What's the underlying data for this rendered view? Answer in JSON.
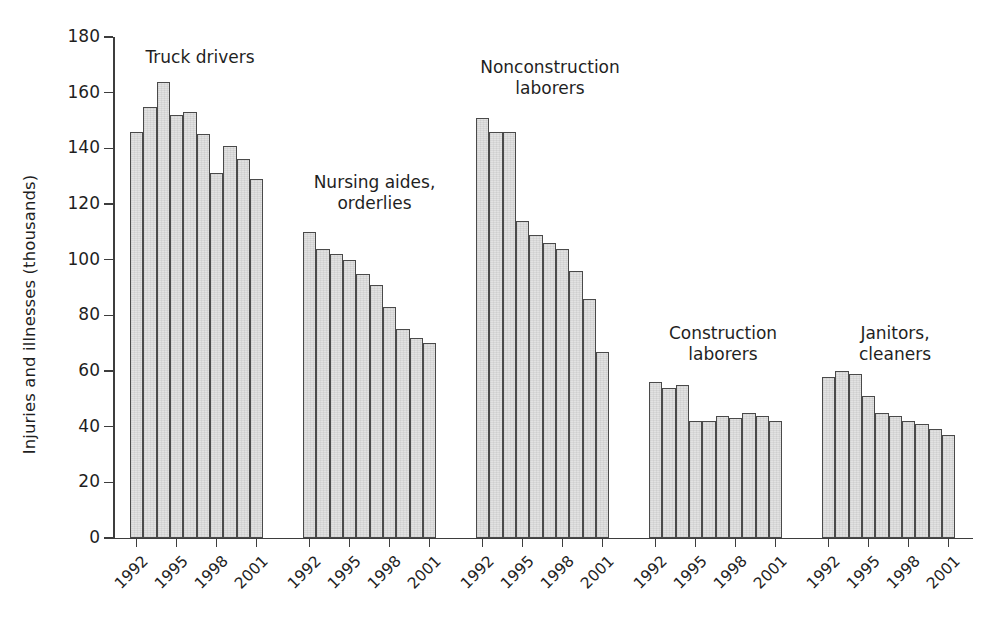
{
  "chart_data": {
    "type": "bar",
    "title": "",
    "xlabel": "",
    "ylabel": "Injuries and illnesses (thousands)",
    "ylim": [
      0,
      180
    ],
    "ytick_labels": [
      "0",
      "20",
      "40",
      "60",
      "80",
      "100",
      "120",
      "140",
      "160",
      "180"
    ],
    "ytick_values": [
      0,
      20,
      40,
      60,
      80,
      100,
      120,
      140,
      160,
      180
    ],
    "grid": false,
    "legend": "none",
    "x": [
      1992,
      1993,
      1994,
      1995,
      1996,
      1997,
      1998,
      1999,
      2000,
      2001
    ],
    "xtick_labels": [
      "1992",
      "1995",
      "1998",
      "2001"
    ],
    "xtick_values": [
      1992,
      1995,
      1998,
      2001
    ],
    "groups": [
      {
        "name": "Truck drivers",
        "label_lines": "Truck drivers",
        "values": [
          146,
          155,
          164,
          152,
          153,
          145,
          131,
          141,
          136,
          129
        ]
      },
      {
        "name": "Nursing aides, orderlies",
        "label_lines": "Nursing aides,\norderlies",
        "values": [
          110,
          104,
          102,
          100,
          95,
          91,
          83,
          75,
          72,
          70
        ]
      },
      {
        "name": "Nonconstruction laborers",
        "label_lines": "Nonconstruction\nlaborers",
        "values": [
          151,
          146,
          146,
          114,
          109,
          106,
          104,
          96,
          86,
          67
        ]
      },
      {
        "name": "Construction laborers",
        "label_lines": "Construction\nlaborers",
        "values": [
          56,
          54,
          55,
          42,
          42,
          44,
          43,
          45,
          44,
          42
        ]
      },
      {
        "name": "Janitors, cleaners",
        "label_lines": "Janitors,\ncleaners",
        "values": [
          58,
          60,
          59,
          51,
          45,
          44,
          42,
          41,
          39,
          37
        ]
      }
    ]
  },
  "colors": {
    "bar_fill": "#e2e2e2",
    "bar_stroke": "#4a4a4a",
    "axis": "#3d3d3d",
    "text": "#1f1f1f",
    "background": "#ffffff"
  }
}
